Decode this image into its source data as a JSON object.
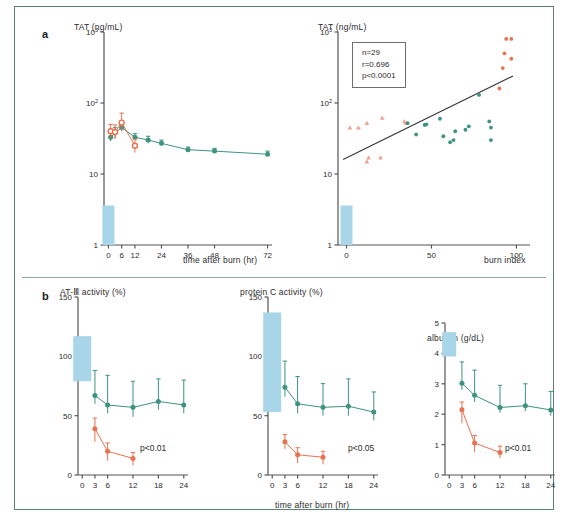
{
  "figure": {
    "panel_a_letter": "a",
    "panel_b_letter": "b"
  },
  "colors": {
    "teal": "#3d9280",
    "orange": "#e8724f",
    "pink": "#f0a090",
    "ref_band": "#a8d5e8",
    "axis": "#555555",
    "frame": "#5c7d74"
  },
  "panels": {
    "a_left": {
      "y_title": "TAT  (ng/mL)",
      "x_title": "time after burn  (hr)",
      "y_ticks": [
        "10",
        "10",
        "10",
        "1"
      ],
      "y_tick_exponents": [
        "3",
        "2",
        "",
        ""
      ],
      "y_tick_display": [
        "10³",
        "10²",
        "10",
        "1"
      ],
      "x_ticks": [
        "0",
        "6",
        "12",
        "24",
        "36",
        "48",
        "72"
      ]
    },
    "a_right": {
      "y_title": "TAT  (ng/mL)",
      "x_title": "burn index",
      "y_tick_display": [
        "10³",
        "10²",
        "10",
        "1"
      ],
      "x_ticks": [
        "0",
        "50",
        "100"
      ],
      "stats": {
        "n": "n=29",
        "r": "r=0.696",
        "p": "p<0.0001"
      }
    },
    "b_left": {
      "y_title": "AT-Ⅲ activity  (%)",
      "x_title": "",
      "y_ticks": [
        "150",
        "100",
        "50",
        "0"
      ],
      "x_ticks": [
        "0",
        "3",
        "6",
        "12",
        "18",
        "24"
      ],
      "pvalue": "p<0.01"
    },
    "b_mid": {
      "y_title": "protein C activity  (%)",
      "x_title": "time after burn  (hr)",
      "y_ticks": [
        "150",
        "100",
        "50",
        "0"
      ],
      "x_ticks": [
        "0",
        "3",
        "6",
        "12",
        "18",
        "24"
      ],
      "pvalue": "p<0.05"
    },
    "b_right": {
      "y_title": "albumin (g/dL)",
      "x_title": "",
      "y_ticks": [
        "5",
        "4",
        "3",
        "2",
        "1",
        "0"
      ],
      "x_ticks": [
        "0",
        "3",
        "6",
        "12",
        "18",
        "24"
      ],
      "pvalue": "p<0.01"
    }
  },
  "chart_data": [
    {
      "id": "a_left",
      "type": "line",
      "title": "TAT (ng/mL) vs time after burn",
      "xlabel": "time after burn  (hr)",
      "ylabel": "TAT  (ng/mL)",
      "yscale": "log",
      "ylim": [
        1,
        1000
      ],
      "xlim": [
        -2,
        74
      ],
      "grid": false,
      "legend": "none",
      "reference_band": {
        "x": 0,
        "low": 1,
        "high": 3.6,
        "color": "#a8d5e8"
      },
      "series": [
        {
          "name": "non-survivors",
          "color": "#e8724f",
          "marker": "circle-open",
          "x": [
            1,
            3,
            6,
            12
          ],
          "y": [
            40,
            39,
            53,
            25
          ],
          "err_low": [
            32,
            31,
            40,
            20
          ],
          "err_high": [
            50,
            49,
            72,
            31
          ]
        },
        {
          "name": "survivors",
          "color": "#3d9280",
          "marker": "circle",
          "x": [
            1,
            3,
            6,
            12,
            18,
            24,
            36,
            48,
            72
          ],
          "y": [
            33,
            38,
            45,
            33,
            30,
            27,
            22,
            21,
            19
          ],
          "err_low": [
            29,
            32,
            40,
            30,
            27,
            25,
            21,
            20,
            18
          ],
          "err_high": [
            38,
            45,
            51,
            37,
            34,
            30,
            24,
            23,
            21
          ]
        }
      ]
    },
    {
      "id": "a_right",
      "type": "scatter",
      "title": "TAT (ng/mL) vs burn index",
      "xlabel": "burn index",
      "ylabel": "TAT  (ng/mL)",
      "yscale": "log",
      "ylim": [
        1,
        1000
      ],
      "xlim": [
        -5,
        108
      ],
      "grid": false,
      "annotations": [
        "n=29",
        "r=0.696",
        "p<0.0001"
      ],
      "reference_band": {
        "x": 0,
        "low": 1,
        "high": 3.6,
        "color": "#a8d5e8"
      },
      "regression_line": {
        "x": [
          -2,
          98
        ],
        "y": [
          16,
          240
        ],
        "color": "#333333"
      },
      "series": [
        {
          "name": "mild",
          "color": "#f0a090",
          "marker": "triangle",
          "points": [
            [
              2,
              45
            ],
            [
              7,
              45
            ],
            [
              12,
              52
            ],
            [
              13,
              17
            ],
            [
              12,
              15
            ],
            [
              20,
              17
            ],
            [
              21,
              62
            ],
            [
              34,
              55
            ],
            [
              35,
              52
            ]
          ]
        },
        {
          "name": "moderate",
          "color": "#3d9280",
          "marker": "circle",
          "points": [
            [
              36,
              52
            ],
            [
              41,
              36
            ],
            [
              46,
              49
            ],
            [
              47,
              50
            ],
            [
              55,
              60
            ],
            [
              57,
              34
            ],
            [
              61,
              28
            ],
            [
              63,
              30
            ],
            [
              64,
              40
            ],
            [
              70,
              42
            ],
            [
              72,
              47
            ],
            [
              78,
              130
            ],
            [
              84,
              55
            ],
            [
              85,
              45
            ],
            [
              85,
              30
            ]
          ]
        },
        {
          "name": "severe",
          "color": "#e8724f",
          "marker": "circle",
          "points": [
            [
              90,
              160
            ],
            [
              92,
              310
            ],
            [
              93,
              500
            ],
            [
              94,
              800
            ],
            [
              97,
              800
            ],
            [
              97,
              420
            ]
          ]
        }
      ]
    },
    {
      "id": "b_left",
      "type": "line",
      "title": "AT-III activity (%)",
      "xlabel": "time after burn  (hr)",
      "ylabel": "AT-Ⅲ activity  (%)",
      "ylim": [
        0,
        150
      ],
      "xlim": [
        -1,
        25
      ],
      "grid": false,
      "annotation": "p<0.01",
      "reference_band": {
        "x": 0,
        "low": 79,
        "high": 117,
        "color": "#a8d5e8"
      },
      "series": [
        {
          "name": "survivors",
          "color": "#3d9280",
          "marker": "circle",
          "x": [
            3,
            6,
            12,
            18,
            24
          ],
          "y": [
            67,
            59,
            57,
            62,
            59
          ],
          "err_low": [
            60,
            52,
            49,
            55,
            52
          ],
          "err_high": [
            88,
            84,
            79,
            81,
            80
          ]
        },
        {
          "name": "non-survivors",
          "color": "#e8724f",
          "marker": "circle",
          "x": [
            3,
            6,
            12
          ],
          "y": [
            39,
            20,
            14
          ],
          "err_low": [
            28,
            12,
            8
          ],
          "err_high": [
            48,
            27,
            19
          ]
        }
      ]
    },
    {
      "id": "b_mid",
      "type": "line",
      "title": "protein C activity (%)",
      "xlabel": "time after burn  (hr)",
      "ylabel": "protein C activity  (%)",
      "ylim": [
        0,
        150
      ],
      "xlim": [
        -1,
        25
      ],
      "grid": false,
      "annotation": "p<0.05",
      "reference_band": {
        "x": 0,
        "low": 53,
        "high": 137,
        "color": "#a8d5e8"
      },
      "series": [
        {
          "name": "survivors",
          "color": "#3d9280",
          "marker": "circle",
          "x": [
            3,
            6,
            12,
            18,
            24
          ],
          "y": [
            74,
            60,
            57,
            58,
            53
          ],
          "err_low": [
            66,
            52,
            50,
            50,
            46
          ],
          "err_high": [
            96,
            83,
            77,
            81,
            70
          ]
        },
        {
          "name": "non-survivors",
          "color": "#e8724f",
          "marker": "circle",
          "x": [
            3,
            6,
            12
          ],
          "y": [
            28,
            17,
            15
          ],
          "err_low": [
            22,
            10,
            9
          ],
          "err_high": [
            34,
            23,
            20
          ]
        }
      ]
    },
    {
      "id": "b_right",
      "type": "line",
      "title": "albumin (g/dL)",
      "xlabel": "time after burn  (hr)",
      "ylabel": "albumin (g/dL)",
      "ylim": [
        0,
        5
      ],
      "xlim": [
        -1,
        25
      ],
      "grid": false,
      "annotation": "p<0.01",
      "reference_band": {
        "x": 0,
        "low": 3.9,
        "high": 4.7,
        "color": "#a8d5e8"
      },
      "series": [
        {
          "name": "survivors",
          "color": "#3d9280",
          "marker": "circle",
          "x": [
            3,
            6,
            12,
            18,
            24
          ],
          "y": [
            3.02,
            2.62,
            2.22,
            2.28,
            2.14
          ],
          "err_low": [
            2.8,
            2.4,
            2.05,
            2.1,
            1.95
          ],
          "err_high": [
            3.72,
            3.45,
            2.95,
            3.0,
            2.75
          ]
        },
        {
          "name": "non-survivors",
          "color": "#e8724f",
          "marker": "circle",
          "x": [
            3,
            6,
            12
          ],
          "y": [
            2.15,
            1.05,
            0.74
          ],
          "err_low": [
            1.7,
            0.75,
            0.55
          ],
          "err_high": [
            2.4,
            1.3,
            0.95
          ]
        }
      ]
    }
  ]
}
